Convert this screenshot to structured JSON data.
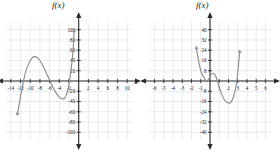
{
  "chart_data": [
    {
      "type": "line",
      "title": "f(x)",
      "xlabel": "x",
      "ylabel": "",
      "xlim": [
        -15,
        11
      ],
      "ylim": [
        -115,
        115
      ],
      "xticks": [
        -14,
        -12,
        -10,
        -8,
        -6,
        -4,
        -2,
        2,
        4,
        6,
        8,
        10
      ],
      "yticks": [
        100,
        80,
        60,
        40,
        20,
        -20,
        -40,
        -60,
        -80,
        -100
      ],
      "xtick_labels": [
        "-14",
        "-12",
        "-10",
        "-8",
        "-6",
        "-4",
        "-2",
        "2",
        "4",
        "6",
        "8",
        "10"
      ],
      "ytick_labels": [
        "100",
        "80",
        "60",
        "40",
        "20",
        "-20",
        "-40",
        "-60",
        "-80",
        "-100"
      ],
      "grid": true,
      "legend": "none",
      "axis_color": "#2b2b2b",
      "curve_color": "#8c8c8c",
      "grid_color": "#d7dde6",
      "arrow_start": "down-left",
      "arrow_end": "up-right",
      "points": [
        {
          "x": -12.6,
          "y": -62
        },
        {
          "x": -12.0,
          "y": -30
        },
        {
          "x": -11.4,
          "y": 0
        },
        {
          "x": -10.6,
          "y": 28
        },
        {
          "x": -9.6,
          "y": 45
        },
        {
          "x": -8.8,
          "y": 47
        },
        {
          "x": -8.0,
          "y": 40
        },
        {
          "x": -7.2,
          "y": 26
        },
        {
          "x": -6.4,
          "y": 10
        },
        {
          "x": -5.9,
          "y": 0
        },
        {
          "x": -5.2,
          "y": -14
        },
        {
          "x": -4.4,
          "y": -27
        },
        {
          "x": -3.6,
          "y": -34
        },
        {
          "x": -3.0,
          "y": -34
        },
        {
          "x": -2.6,
          "y": -28
        },
        {
          "x": -2.2,
          "y": -16
        },
        {
          "x": -1.9,
          "y": 0
        },
        {
          "x": -1.6,
          "y": 20
        },
        {
          "x": -1.3,
          "y": 45
        },
        {
          "x": -1.1,
          "y": 68
        },
        {
          "x": -0.95,
          "y": 95
        }
      ]
    },
    {
      "type": "line",
      "title": "f(x)",
      "xlabel": "",
      "ylabel": "",
      "xlim": [
        -6.6,
        6.6
      ],
      "ylim": [
        -46,
        46
      ],
      "xticks": [
        -6,
        -5,
        -4,
        -3,
        -2,
        -1,
        1,
        2,
        3,
        4,
        5,
        6
      ],
      "yticks": [
        40,
        32,
        24,
        16,
        8,
        -8,
        -16,
        -24,
        -32,
        -40
      ],
      "xtick_labels": [
        "-6",
        "-5",
        "-4",
        "-3",
        "-2",
        "-1",
        "1",
        "2",
        "3",
        "4",
        "5",
        "6"
      ],
      "ytick_labels": [
        "40",
        "32",
        "24",
        "16",
        "8",
        "-8",
        "-16",
        "-24",
        "-32",
        "-40"
      ],
      "grid": true,
      "legend": "none",
      "axis_color": "#2b2b2b",
      "curve_color": "#8c8c8c",
      "grid_color": "#d7dde6",
      "arrow_start": "up-left",
      "arrow_end": "up-right",
      "points": [
        {
          "x": -1.45,
          "y": 25
        },
        {
          "x": -1.3,
          "y": 18
        },
        {
          "x": -1.1,
          "y": 11
        },
        {
          "x": -0.9,
          "y": 6
        },
        {
          "x": -0.6,
          "y": 2
        },
        {
          "x": -0.35,
          "y": 0
        },
        {
          "x": -0.1,
          "y": 2
        },
        {
          "x": 0.1,
          "y": 5
        },
        {
          "x": 0.35,
          "y": 6
        },
        {
          "x": 0.6,
          "y": 4
        },
        {
          "x": 0.8,
          "y": 0
        },
        {
          "x": 1.0,
          "y": -5
        },
        {
          "x": 1.3,
          "y": -11
        },
        {
          "x": 1.6,
          "y": -15
        },
        {
          "x": 1.9,
          "y": -17
        },
        {
          "x": 2.2,
          "y": -17
        },
        {
          "x": 2.45,
          "y": -14
        },
        {
          "x": 2.7,
          "y": -8
        },
        {
          "x": 2.9,
          "y": 0
        },
        {
          "x": 3.05,
          "y": 10
        },
        {
          "x": 3.2,
          "y": 22
        }
      ]
    }
  ],
  "left_chart": {
    "title": "f(x)",
    "xaxis_label": "x"
  },
  "right_chart": {
    "title": "f(x)"
  }
}
